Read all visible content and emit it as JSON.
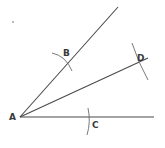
{
  "diagram": {
    "colors": {
      "line": "#4a4a4a",
      "arc": "#6a6a6a",
      "label": "#3a3a3a",
      "background": "#ffffff"
    },
    "points": {
      "A": {
        "label": "A",
        "x": 20,
        "y": 117
      },
      "B": {
        "label": "B",
        "x": 66,
        "y": 60
      },
      "C": {
        "label": "C",
        "x": 88,
        "y": 117
      },
      "D": {
        "label": "D",
        "x": 135,
        "y": 64
      }
    },
    "rays": [
      {
        "name": "upper-ray",
        "from": "A",
        "to": [
          118,
          7
        ]
      },
      {
        "name": "bisector-ray",
        "from": "A",
        "to": [
          148,
          58
        ]
      },
      {
        "name": "base-ray",
        "from": "A",
        "to": [
          154,
          117
        ]
      }
    ]
  }
}
